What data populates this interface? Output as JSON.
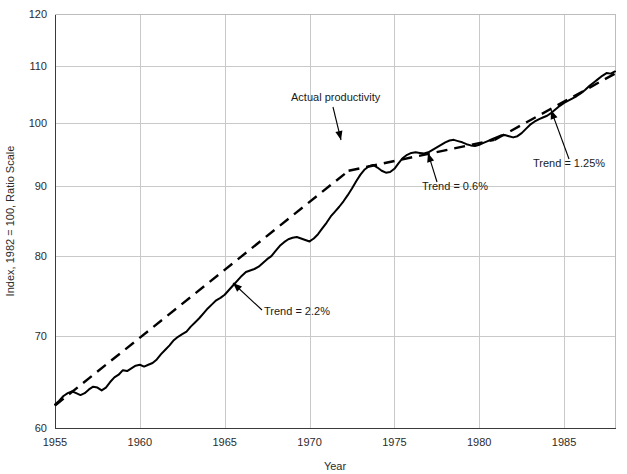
{
  "chart_data": {
    "type": "line",
    "title": "",
    "xlabel": "Year",
    "ylabel": "Index, 1982 = 100, Ratio Scale",
    "yscale": "log",
    "ylim": [
      60,
      120
    ],
    "xlim": [
      1955,
      1988
    ],
    "grid": true,
    "legend": "none",
    "ytick_labels": [
      "60",
      "70",
      "80",
      "90",
      "100",
      "110",
      "120"
    ],
    "yticks": [
      60,
      70,
      80,
      90,
      100,
      110,
      120
    ],
    "xtick_labels": [
      "1955",
      "1960",
      "1965",
      "1970",
      "1975",
      "1980",
      "1985"
    ],
    "xticks": [
      1955,
      1960,
      1965,
      1970,
      1975,
      1980,
      1985
    ],
    "series": [
      {
        "name": "Actual productivity",
        "style": "solid",
        "color": "#000000",
        "x": [
          1955.0,
          1955.25,
          1955.5,
          1955.75,
          1956.0,
          1956.25,
          1956.5,
          1956.75,
          1957.0,
          1957.25,
          1957.5,
          1957.75,
          1958.0,
          1958.25,
          1958.5,
          1958.75,
          1959.0,
          1959.25,
          1959.5,
          1959.75,
          1960.0,
          1960.25,
          1960.5,
          1960.75,
          1961.0,
          1961.25,
          1961.5,
          1961.75,
          1962.0,
          1962.25,
          1962.5,
          1962.75,
          1963.0,
          1963.25,
          1963.5,
          1963.75,
          1964.0,
          1964.25,
          1964.5,
          1964.75,
          1965.0,
          1965.25,
          1965.5,
          1965.75,
          1966.0,
          1966.25,
          1966.5,
          1966.75,
          1967.0,
          1967.25,
          1967.5,
          1967.75,
          1968.0,
          1968.25,
          1968.5,
          1968.75,
          1969.0,
          1969.25,
          1969.5,
          1969.75,
          1970.0,
          1970.25,
          1970.5,
          1970.75,
          1971.0,
          1971.25,
          1971.5,
          1971.75,
          1972.0,
          1972.25,
          1972.5,
          1972.75,
          1973.0,
          1973.25,
          1973.5,
          1973.75,
          1974.0,
          1974.25,
          1974.5,
          1974.75,
          1975.0,
          1975.25,
          1975.5,
          1975.75,
          1976.0,
          1976.25,
          1976.5,
          1976.75,
          1977.0,
          1977.25,
          1977.5,
          1977.75,
          1978.0,
          1978.25,
          1978.5,
          1978.75,
          1979.0,
          1979.25,
          1979.5,
          1979.75,
          1980.0,
          1980.25,
          1980.5,
          1980.75,
          1981.0,
          1981.25,
          1981.5,
          1981.75,
          1982.0,
          1982.25,
          1982.5,
          1982.75,
          1983.0,
          1983.25,
          1983.5,
          1983.75,
          1984.0,
          1984.25,
          1984.5,
          1984.75,
          1985.0,
          1985.25,
          1985.5,
          1985.75,
          1986.0,
          1986.25,
          1986.5,
          1986.75,
          1987.0,
          1987.25,
          1987.5,
          1987.75,
          1988.0
        ],
        "y": [
          62.4,
          62.8,
          63.3,
          63.6,
          63.8,
          63.6,
          63.4,
          63.6,
          64.0,
          64.3,
          64.2,
          63.9,
          64.2,
          64.8,
          65.3,
          65.6,
          66.1,
          66.0,
          66.3,
          66.6,
          66.7,
          66.5,
          66.7,
          66.9,
          67.3,
          67.9,
          68.4,
          68.9,
          69.5,
          69.9,
          70.2,
          70.5,
          71.1,
          71.6,
          72.1,
          72.7,
          73.3,
          73.8,
          74.3,
          74.6,
          75.0,
          75.6,
          76.2,
          76.8,
          77.4,
          77.9,
          78.1,
          78.3,
          78.6,
          79.1,
          79.6,
          80.0,
          80.7,
          81.4,
          81.9,
          82.3,
          82.5,
          82.6,
          82.4,
          82.2,
          82.0,
          82.4,
          83.0,
          83.8,
          84.6,
          85.5,
          86.2,
          86.9,
          87.7,
          88.6,
          89.6,
          90.7,
          91.7,
          92.5,
          93.0,
          93.2,
          92.8,
          92.3,
          92.0,
          92.1,
          92.6,
          93.5,
          94.3,
          94.8,
          95.1,
          95.2,
          95.1,
          95.0,
          95.2,
          95.6,
          96.0,
          96.4,
          96.8,
          97.1,
          97.2,
          97.0,
          96.8,
          96.5,
          96.3,
          96.2,
          96.4,
          96.7,
          97.0,
          97.3,
          97.6,
          97.9,
          98.0,
          97.8,
          97.6,
          97.8,
          98.3,
          99.0,
          99.7,
          100.2,
          100.6,
          100.9,
          101.2,
          101.7,
          102.3,
          102.9,
          103.4,
          103.8,
          104.2,
          104.6,
          105.1,
          105.7,
          106.4,
          107.0,
          107.6,
          108.2,
          108.7,
          108.6,
          109.0
        ]
      },
      {
        "name": "Trend = 2.2%",
        "style": "dashed",
        "color": "#000000",
        "segment_label": "Trend = 2.2%",
        "x": [
          1955.0,
          1972.3
        ],
        "y": [
          62.3,
          92.3
        ]
      },
      {
        "name": "Trend = 0.6%",
        "style": "dashed",
        "color": "#000000",
        "segment_label": "Trend = 0.6%",
        "x": [
          1972.3,
          1980.9
        ],
        "y": [
          92.3,
          97.2
        ]
      },
      {
        "name": "Trend = 1.25%",
        "style": "dashed",
        "color": "#000000",
        "segment_label": "Trend = 1.25%",
        "x": [
          1980.9,
          1988.0
        ],
        "y": [
          97.2,
          108.6
        ]
      }
    ],
    "annotations": [
      {
        "text": "Actual productivity",
        "x_px": 291,
        "y_px": 101
      },
      {
        "text": "Trend = 2.2%",
        "x_px": 264,
        "y_px": 315
      },
      {
        "text": "Trend = 0.6%",
        "x_px": 422,
        "y_px": 190
      },
      {
        "text": "Trend = 1.25%",
        "x_px": 533,
        "y_px": 167
      }
    ]
  }
}
